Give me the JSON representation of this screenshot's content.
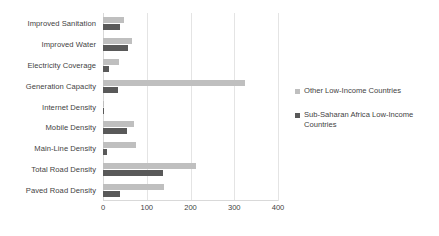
{
  "chart_data": {
    "type": "bar",
    "orientation": "horizontal",
    "title": "",
    "xlabel": "",
    "ylabel": "",
    "xlim": [
      0,
      400
    ],
    "xticks": [
      0,
      100,
      200,
      300,
      400
    ],
    "grid": true,
    "legend_position": "right",
    "categories": [
      "Improved Sanitation",
      "Improved Water",
      "Electricity Coverage",
      "Generation Capacity",
      "Internet Density",
      "Mobile Density",
      "Main-Line Density",
      "Total Road Density",
      "Paved Road Density"
    ],
    "series": [
      {
        "name": "Other Low-Income Countries",
        "color": "#bfbfbf",
        "values": [
          48,
          66,
          36,
          325,
          3,
          71,
          75,
          213,
          139
        ]
      },
      {
        "name": "Sub-Saharan Africa Low-Income Countries",
        "color": "#595959",
        "values": [
          38,
          57,
          14,
          34,
          2,
          55,
          10,
          137,
          38
        ]
      }
    ]
  },
  "legend": {
    "items": [
      {
        "label": "Other Low-Income Countries",
        "color": "#bfbfbf"
      },
      {
        "label": "Sub-Saharan Africa Low-Income Countries",
        "color": "#595959"
      }
    ]
  }
}
